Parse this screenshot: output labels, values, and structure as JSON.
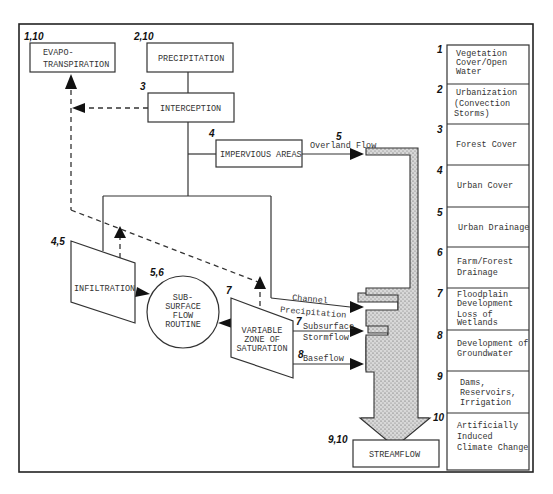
{
  "diagram": {
    "nodes": {
      "evapotranspiration": {
        "number": "1,10",
        "lines": [
          "EVAPO-",
          "TRANSPIRATION"
        ]
      },
      "precipitation": {
        "number": "2,10",
        "lines": [
          "PRECIPITATION"
        ]
      },
      "interception": {
        "number": "3",
        "lines": [
          "INTERCEPTION"
        ]
      },
      "impervious_areas": {
        "number": "4",
        "lines": [
          "IMPERVIOUS AREAS"
        ]
      },
      "infiltration": {
        "number": "4,5",
        "lines": [
          "INFILTRATION"
        ]
      },
      "subsurface_flow": {
        "number": "5,6",
        "lines": [
          "SUB-",
          "SURFACE",
          "FLOW",
          "ROUTINE"
        ]
      },
      "variable_zone": {
        "number": "7",
        "lines": [
          "VARIABLE",
          "ZONE OF",
          "SATURATION"
        ]
      },
      "streamflow": {
        "number": "9,10",
        "lines": [
          "STREAMFLOW"
        ]
      }
    },
    "flows": {
      "overland_flow": {
        "number": "5",
        "label": "Overland Flow"
      },
      "channel_precipitation": {
        "lines": [
          "Channel",
          "Precipitation"
        ]
      },
      "subsurface_stormflow": {
        "number": "7",
        "lines": [
          "Subsurface",
          "Stormflow"
        ]
      },
      "baseflow": {
        "number": "8",
        "label": "Baseflow"
      }
    }
  },
  "legend": {
    "items": [
      {
        "number": "1",
        "lines": [
          "Vegetation",
          "Cover/Open",
          "Water"
        ]
      },
      {
        "number": "2",
        "lines": [
          "Urbanization",
          "(Convection",
          " Storms)"
        ]
      },
      {
        "number": "3",
        "lines": [
          "Forest Cover"
        ]
      },
      {
        "number": "4",
        "lines": [
          "Urban Cover"
        ]
      },
      {
        "number": "5",
        "lines": [
          "Urban Drainage"
        ]
      },
      {
        "number": "6",
        "lines": [
          "Farm/Forest",
          "Drainage"
        ]
      },
      {
        "number": "7",
        "lines": [
          "Floodplain",
          "Development",
          "Loss of",
          "Wetlands"
        ]
      },
      {
        "number": "8",
        "lines": [
          "Development of",
          "Groundwater"
        ]
      },
      {
        "number": "9",
        "lines": [
          "Dams,",
          "Reservoirs,",
          "Irrigation"
        ]
      },
      {
        "number": "10",
        "lines": [
          "Artificially",
          "Induced",
          "Climate Change"
        ]
      }
    ]
  }
}
